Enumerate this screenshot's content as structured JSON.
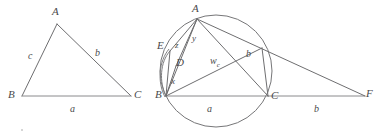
{
  "figure": {
    "stroke_color": "#6e6e70",
    "label_color": "#4a4a4c",
    "background_color": "#ffffff",
    "width": 387,
    "height": 140
  },
  "left_diagram": {
    "name": "plain-triangle-abc",
    "description": "Triangle ABC with sides labelled a, b, c",
    "vertices": [
      {
        "id": "A",
        "label": "A",
        "x": 57,
        "y": 24
      },
      {
        "id": "B",
        "label": "B",
        "x": 22,
        "y": 97
      },
      {
        "id": "C",
        "label": "C",
        "x": 131,
        "y": 97
      }
    ],
    "sides": [
      {
        "id": "c",
        "label": "c",
        "from": "A",
        "to": "B",
        "label_x": 31,
        "label_y": 57
      },
      {
        "id": "b",
        "label": "b",
        "from": "A",
        "to": "C",
        "label_x": 98,
        "label_y": 54
      },
      {
        "id": "a",
        "label": "a",
        "from": "B",
        "to": "C",
        "label_x": 72,
        "label_y": 110
      }
    ]
  },
  "right_diagram": {
    "name": "circumcircle-triangle-abc",
    "description": "Triangle ABC inscribed in its circumcircle with cevian AD extended to E, angle-bisector w_c, and external point F on line BC",
    "circle": {
      "cx": 216,
      "cy": 71,
      "r": 56
    },
    "vertices": [
      {
        "id": "A",
        "label": "A",
        "x": 197,
        "y": 19
      },
      {
        "id": "B",
        "label": "B",
        "x": 166,
        "y": 96
      },
      {
        "id": "C",
        "label": "C",
        "x": 268,
        "y": 97
      },
      {
        "id": "D",
        "label": "D",
        "x": 181,
        "y": 59
      },
      {
        "id": "E",
        "label": "E",
        "x": 170,
        "y": 51
      },
      {
        "id": "F",
        "label": "F",
        "x": 365,
        "y": 96
      }
    ],
    "segment_labels": [
      {
        "id": "a",
        "label": "a",
        "label_x": 209,
        "label_y": 110
      },
      {
        "id": "b",
        "label": "b",
        "label_x": 248,
        "label_y": 55
      },
      {
        "id": "b_ext",
        "label": "b",
        "label_x": 316,
        "label_y": 110
      },
      {
        "id": "wc",
        "label": "w",
        "sublabel": "c",
        "label_x": 216,
        "label_y": 63
      },
      {
        "id": "x",
        "label": "x",
        "label_x": 173,
        "label_y": 83
      },
      {
        "id": "y",
        "label": "y",
        "label_x": 194,
        "label_y": 41
      },
      {
        "id": "z",
        "label": "z",
        "label_x": 177,
        "label_y": 46
      }
    ]
  }
}
